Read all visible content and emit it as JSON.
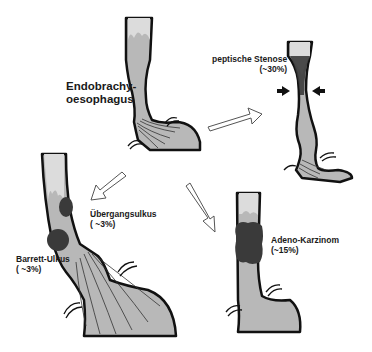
{
  "diagram": {
    "topic": "Komplikationen des Endobrachyoesophagus",
    "colors": {
      "tissue_fill": "#b8b8b8",
      "upper_mucosa": "#dcdcdc",
      "outline": "#111111",
      "lesion": "#3a3a3a",
      "background": "#ffffff"
    },
    "nodes": [
      {
        "id": "center",
        "label_line1": "Endobrachy-",
        "label_line2": "oesophagus"
      },
      {
        "id": "stenose",
        "label_line1": "peptische Stenose",
        "label_line2": "(~30%)"
      },
      {
        "id": "ulkus",
        "label_line1": "Übergangsulkus",
        "label_line2": "( ~3%)"
      },
      {
        "id": "barrett",
        "label_line1": "Barrett-Ulkus",
        "label_line2": "( ~3%)"
      },
      {
        "id": "karzinom",
        "label_line1": "Adeno-Karzinom",
        "label_line2": "(~15%)"
      }
    ],
    "edges": [
      {
        "from": "center",
        "to": "stenose",
        "type": "hollow-arrow"
      },
      {
        "from": "center",
        "to": "ulkus",
        "type": "hollow-arrow"
      },
      {
        "from": "center",
        "to": "karzinom",
        "type": "hollow-arrow"
      }
    ]
  }
}
